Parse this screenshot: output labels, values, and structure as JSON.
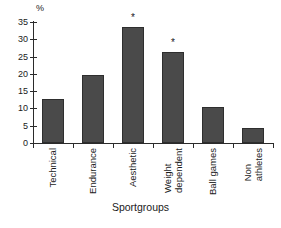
{
  "chart_data": {
    "type": "bar",
    "title": "",
    "subtitle": "",
    "xlabel": "Sportgroups",
    "ylabel": "%",
    "categories": [
      "Technical",
      "Weight dependent",
      "Aesthetic",
      "Endurance",
      "Ball games",
      "Non athletes"
    ],
    "category_labels": [
      {
        "lines": [
          "Technical"
        ]
      },
      {
        "lines": [
          "Endurance"
        ]
      },
      {
        "lines": [
          "Aesthetic"
        ]
      },
      {
        "lines": [
          "Weight",
          "dependent"
        ]
      },
      {
        "lines": [
          "Ball games"
        ]
      },
      {
        "lines": [
          "Non",
          "athletes"
        ]
      }
    ],
    "bars": [
      {
        "label": "Technical",
        "value": 12.7,
        "significant": false,
        "marker": ""
      },
      {
        "label": "Endurance",
        "value": 19.8,
        "significant": false,
        "marker": ""
      },
      {
        "label": "Aesthetic",
        "value": 33.7,
        "significant": true,
        "marker": "*"
      },
      {
        "label": "Weight dependent",
        "value": 26.3,
        "significant": true,
        "marker": "*"
      },
      {
        "label": "Ball games",
        "value": 10.5,
        "significant": false,
        "marker": ""
      },
      {
        "label": "Non athletes",
        "value": 4.3,
        "significant": false,
        "marker": ""
      }
    ],
    "values": [
      12.7,
      19.8,
      33.7,
      26.3,
      10.5,
      4.3
    ],
    "ylim": [
      0,
      35
    ],
    "yticks": [
      0,
      5,
      10,
      15,
      20,
      25,
      30,
      35
    ],
    "ytick_labels": [
      "0",
      "5",
      "10",
      "15",
      "20",
      "25",
      "30",
      "35"
    ],
    "grid": false,
    "legend": null,
    "annotations": [
      {
        "text": "*",
        "over_category": "Aesthetic"
      },
      {
        "text": "*",
        "over_category": "Weight dependent"
      }
    ],
    "colors": {
      "bar_fill": "#4a4a4a",
      "bar_edge": "#2e2e2e",
      "axis": "#2b2b2b",
      "text": "#1a1a1a",
      "background": "#ffffff"
    }
  },
  "caption": {
    "cut_off_text": ""
  }
}
